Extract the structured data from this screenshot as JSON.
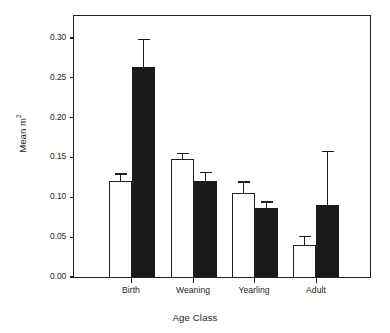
{
  "chart_data": {
    "type": "bar",
    "title": "",
    "xlabel": "Age Class",
    "ylabel": "Mean m",
    "ylabel_sup": "2",
    "categories": [
      "Birth",
      "Weaning",
      "Yearling",
      "Adult"
    ],
    "ylim": [
      0.0,
      0.33
    ],
    "ytick_values": [
      0.0,
      0.05,
      0.1,
      0.15,
      0.2,
      0.25,
      0.3
    ],
    "ytick_labels": [
      "0.00",
      "0.05",
      "0.10",
      "0.15",
      "0.20",
      "0.25",
      "0.30"
    ],
    "grid": false,
    "legend": "none",
    "series": [
      {
        "name": "open-bar",
        "fill": "#ffffff",
        "edge": "#231f20",
        "values": [
          0.12,
          0.148,
          0.106,
          0.04
        ],
        "errors_upper": [
          0.01,
          0.008,
          0.014,
          0.012
        ],
        "error_tops": [
          0.13,
          0.156,
          0.12,
          0.052
        ]
      },
      {
        "name": "filled-bar",
        "fill": "#1a1a1a",
        "edge": "#1a1a1a",
        "values": [
          0.264,
          0.121,
          0.086,
          0.09
        ],
        "errors_upper": [
          0.035,
          0.011,
          0.009,
          0.068
        ],
        "error_tops": [
          0.299,
          0.132,
          0.095,
          0.158
        ]
      }
    ],
    "bar_geometry": {
      "white_x": [
        108,
        170,
        231,
        292
      ],
      "black_x": [
        131,
        193,
        254,
        315
      ],
      "bar_width": 23,
      "tick_x": [
        131,
        193,
        254,
        316
      ]
    }
  }
}
